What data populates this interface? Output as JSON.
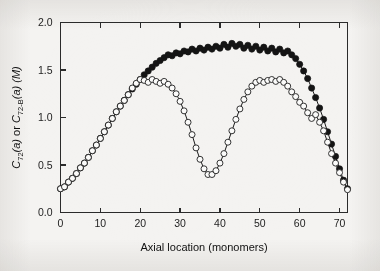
{
  "figure": {
    "background_color": "#f4f3f1",
    "ink_color": "#1b1b1b"
  },
  "chart_data": {
    "type": "line",
    "title": "",
    "subtitle": "",
    "xlabel": "Axial location (monomers)",
    "ylabel": "C72(a) or C72-B(a)  (M)",
    "ylabel_parts": {
      "lead": "C",
      "lead_sub": "72",
      "lead_arg": "(a)",
      "conjunction": " or ",
      "second": "C",
      "second_sub": "72-B",
      "second_arg": "(a)",
      "units": "(M)"
    },
    "xlim": [
      0,
      72
    ],
    "ylim": [
      0.0,
      2.0
    ],
    "xticks": [
      0,
      10,
      20,
      30,
      40,
      50,
      60,
      70
    ],
    "xticklabels": [
      "0",
      "10",
      "20",
      "30",
      "40",
      "50",
      "60",
      "70"
    ],
    "yticks": [
      0.0,
      0.5,
      1.0,
      1.5,
      2.0
    ],
    "yticklabels": [
      "0.0",
      "0.5",
      "1.0",
      "1.5",
      "2.0"
    ],
    "grid": false,
    "legend": false,
    "legend_position": "none",
    "frame": "box",
    "tick_direction": "in",
    "top_axis_ticks": true,
    "right_axis_ticks": false,
    "x": [
      0,
      1,
      2,
      3,
      4,
      5,
      6,
      7,
      8,
      9,
      10,
      11,
      12,
      13,
      14,
      15,
      16,
      17,
      18,
      19,
      20,
      21,
      22,
      23,
      24,
      25,
      26,
      27,
      28,
      29,
      30,
      31,
      32,
      33,
      34,
      35,
      36,
      37,
      38,
      39,
      40,
      41,
      42,
      43,
      44,
      45,
      46,
      47,
      48,
      49,
      50,
      51,
      52,
      53,
      54,
      55,
      56,
      57,
      58,
      59,
      60,
      61,
      62,
      63,
      64,
      65,
      66,
      67,
      68,
      69,
      70,
      71,
      72
    ],
    "series": [
      {
        "name": "C72(a)",
        "marker": "filled-circle",
        "marker_size": 3.1,
        "color": "#141414",
        "values": [
          0.25,
          0.27,
          0.32,
          0.36,
          0.41,
          0.47,
          0.52,
          0.58,
          0.65,
          0.71,
          0.78,
          0.85,
          0.92,
          0.99,
          1.06,
          1.12,
          1.18,
          1.24,
          1.3,
          1.35,
          1.4,
          1.45,
          1.49,
          1.53,
          1.57,
          1.6,
          1.63,
          1.66,
          1.65,
          1.68,
          1.67,
          1.7,
          1.69,
          1.72,
          1.7,
          1.73,
          1.71,
          1.74,
          1.72,
          1.75,
          1.73,
          1.77,
          1.74,
          1.78,
          1.75,
          1.77,
          1.73,
          1.76,
          1.72,
          1.75,
          1.71,
          1.74,
          1.7,
          1.73,
          1.69,
          1.72,
          1.68,
          1.7,
          1.66,
          1.62,
          1.56,
          1.49,
          1.41,
          1.31,
          1.21,
          1.1,
          0.98,
          0.85,
          0.72,
          0.59,
          0.46,
          0.34,
          0.25
        ]
      },
      {
        "name": "C72-B(a)",
        "marker": "open-circle",
        "marker_size": 3.0,
        "color": "#1e1e1e",
        "values": [
          0.25,
          0.27,
          0.32,
          0.36,
          0.41,
          0.47,
          0.52,
          0.58,
          0.65,
          0.71,
          0.78,
          0.85,
          0.92,
          0.99,
          1.06,
          1.12,
          1.18,
          1.24,
          1.31,
          1.36,
          1.4,
          1.39,
          1.37,
          1.4,
          1.38,
          1.36,
          1.38,
          1.35,
          1.31,
          1.25,
          1.17,
          1.07,
          0.95,
          0.82,
          0.68,
          0.56,
          0.46,
          0.4,
          0.4,
          0.44,
          0.52,
          0.62,
          0.74,
          0.86,
          0.98,
          1.09,
          1.19,
          1.27,
          1.33,
          1.37,
          1.39,
          1.37,
          1.39,
          1.4,
          1.38,
          1.4,
          1.37,
          1.33,
          1.27,
          1.22,
          1.16,
          1.12,
          1.05,
          0.99,
          1.03,
          0.95,
          0.86,
          0.74,
          0.62,
          0.52,
          0.42,
          0.32,
          0.24
        ]
      }
    ]
  }
}
